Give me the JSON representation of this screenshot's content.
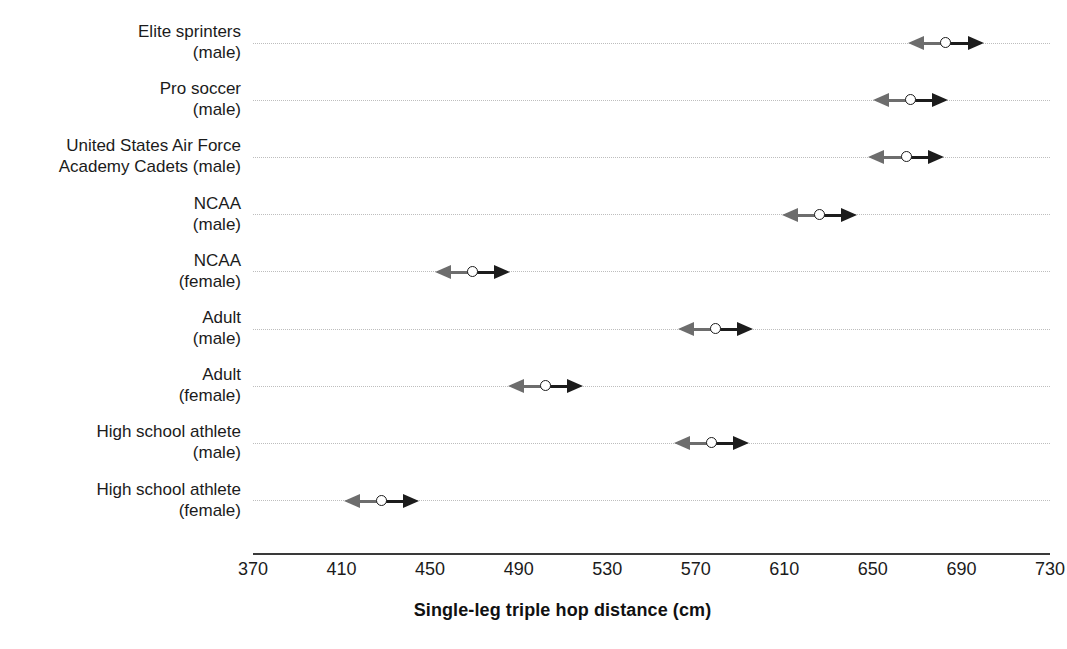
{
  "chart_data": {
    "type": "scatter",
    "title": "",
    "xlabel": "Single-leg triple hop distance (cm)",
    "ylabel": "",
    "xlim": [
      370,
      730
    ],
    "xticks": [
      370,
      410,
      450,
      490,
      530,
      570,
      610,
      650,
      690,
      730
    ],
    "xtick_labels": [
      "370",
      "410",
      "450",
      "490",
      "530",
      "570",
      "610",
      "650",
      "690",
      "730"
    ],
    "grid": "horizontal dotted gridlines, one per category",
    "legend": "none",
    "marker": "open circle with bidirectional arrows (left arrow gray, right arrow black)",
    "categories": [
      "Elite sprinters (male)",
      "Pro soccer (male)",
      "United States Air Force Academy Cadets (male)",
      "NCAA (male)",
      "NCAA (female)",
      "Adult (male)",
      "Adult (female)",
      "High school athlete (male)",
      "High school athlete (female)"
    ],
    "values": [
      683,
      667,
      665,
      626,
      469,
      579,
      502,
      577,
      428
    ],
    "arrow_span_cm": 17,
    "points": [
      {
        "category_line1": "Elite sprinters",
        "category_line2": "(male)",
        "value": 683,
        "low": 666,
        "high": 700
      },
      {
        "category_line1": "Pro soccer",
        "category_line2": "(male)",
        "value": 667,
        "low": 650,
        "high": 684
      },
      {
        "category_line1": "United States Air Force",
        "category_line2": "Academy Cadets (male)",
        "value": 665,
        "low": 648,
        "high": 682
      },
      {
        "category_line1": "NCAA",
        "category_line2": "(male)",
        "value": 626,
        "low": 609,
        "high": 643
      },
      {
        "category_line1": "NCAA",
        "category_line2": "(female)",
        "value": 469,
        "low": 452,
        "high": 486
      },
      {
        "category_line1": "Adult",
        "category_line2": "(male)",
        "value": 579,
        "low": 562,
        "high": 596
      },
      {
        "category_line1": "Adult",
        "category_line2": "(female)",
        "value": 502,
        "low": 485,
        "high": 519
      },
      {
        "category_line1": "High school athlete",
        "category_line2": "(male)",
        "value": 577,
        "low": 560,
        "high": 594
      },
      {
        "category_line1": "High school athlete",
        "category_line2": "(female)",
        "value": 428,
        "low": 411,
        "high": 445
      }
    ]
  },
  "colors": {
    "marker_outline": "#1c1c1c",
    "marker_fill": "#ffffff",
    "arrow_left": "#6d6d6d",
    "arrow_right": "#1c1c1c",
    "gridline": "#9a9a9a",
    "axis": "#3a3a3a",
    "text": "#1b1b1b"
  },
  "axis": {
    "title": "Single-leg triple hop distance (cm)"
  },
  "caption": {
    "stub": ""
  }
}
